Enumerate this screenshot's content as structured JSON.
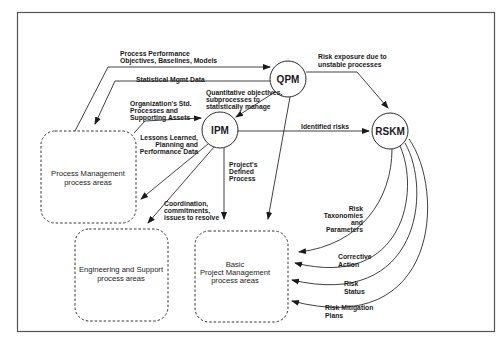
{
  "diagram": {
    "title": "",
    "colors": {
      "line": "#2a2a2a",
      "frame": "#555555",
      "background": "#ffffff"
    },
    "nodes": {
      "qpm": {
        "label": "QPM"
      },
      "ipm": {
        "label": "IPM"
      },
      "rskm": {
        "label": "RSKM"
      }
    },
    "boxes": {
      "process_mgmt": {
        "line1": "Process Management",
        "line2": "process areas"
      },
      "eng_support": {
        "line1": "Engineering and Support",
        "line2": "process areas"
      },
      "basic_pm": {
        "line1": "Basic",
        "line2": "Project Management",
        "line3": "process areas"
      }
    },
    "edges": {
      "ppo": {
        "line1": "Process Performance",
        "line2": "Objectives, Baselines, Models"
      },
      "smd": {
        "line1": "Statistical Mgmt Data"
      },
      "osp": {
        "line1": "Organization's Std.",
        "line2": "Processes and",
        "line3": "Supporting Assets"
      },
      "qo": {
        "line1": "Quantitative objectives,",
        "line2": "subprocesses to",
        "line3": "statistically manage"
      },
      "risk_exposure": {
        "line1": "Risk exposure due to",
        "line2": "unstable processes"
      },
      "identified_risks": {
        "line1": "Identified risks"
      },
      "lessons": {
        "line1": "Lessons Learned,",
        "line2": "Planning and",
        "line3": "Performance Data"
      },
      "defined_process": {
        "line1": "Project's",
        "line2": "Defined",
        "line3": "Process"
      },
      "coordination": {
        "line1": "Coordination,",
        "line2": "commitments,",
        "line3": "issues to resolve"
      },
      "taxonomies": {
        "line1": "Risk",
        "line2": "Taxonomies",
        "line3": "and",
        "line4": "Parameters"
      },
      "corrective": {
        "line1": "Corrective",
        "line2": "Action"
      },
      "status": {
        "line1": "Risk",
        "line2": "Status"
      },
      "mitigation": {
        "line1": "Risk Mitigation",
        "line2": "Plans"
      }
    }
  }
}
